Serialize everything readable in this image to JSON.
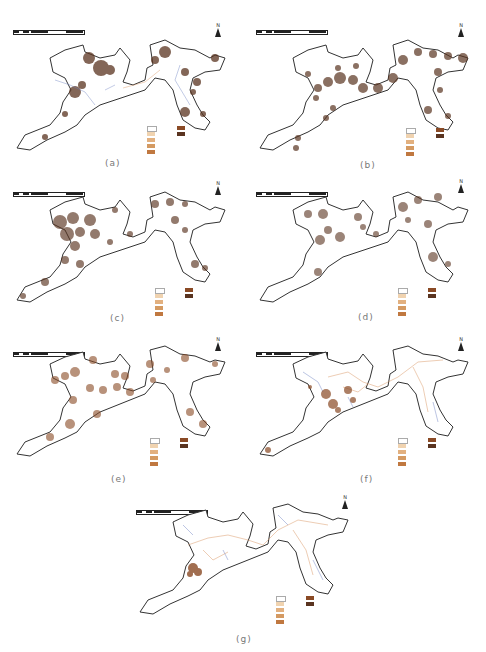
{
  "figure": {
    "panels": [
      {
        "id": "a",
        "caption": "(a)"
      },
      {
        "id": "b",
        "caption": "(b)"
      },
      {
        "id": "c",
        "caption": "(c)"
      },
      {
        "id": "d",
        "caption": "(d)"
      },
      {
        "id": "e",
        "caption": "(e)"
      },
      {
        "id": "f",
        "caption": "(f)"
      },
      {
        "id": "g",
        "caption": "(g)"
      }
    ],
    "scale_bar": {
      "ticks": [
        "0",
        "4",
        "8",
        "16",
        "24",
        "32"
      ],
      "unit": "km"
    },
    "north_label": "N",
    "colors": {
      "boundary": "#333333",
      "river": "#6a7fc0",
      "road": "#d9905a",
      "density_low": "#f5e6cf",
      "density_mid": "#d49a62",
      "density_high": "#5a3420"
    }
  }
}
